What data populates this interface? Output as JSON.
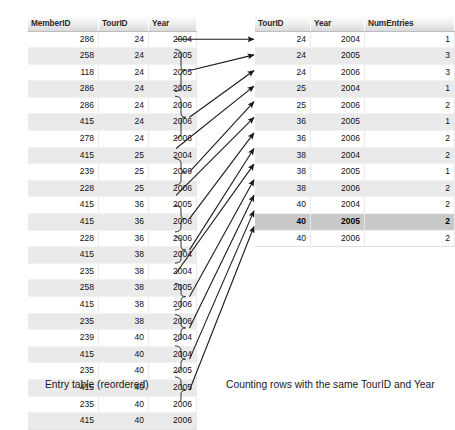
{
  "left_table": {
    "name": "entry-table",
    "headers": [
      "MemberID",
      "TourID",
      "Year"
    ],
    "rows": [
      {
        "member": "286",
        "tour": "24",
        "year": "2004",
        "alt": false
      },
      {
        "member": "258",
        "tour": "24",
        "year": "2005",
        "alt": true
      },
      {
        "member": "118",
        "tour": "24",
        "year": "2005",
        "alt": false
      },
      {
        "member": "286",
        "tour": "24",
        "year": "2005",
        "alt": true
      },
      {
        "member": "286",
        "tour": "24",
        "year": "2006",
        "alt": false
      },
      {
        "member": "415",
        "tour": "24",
        "year": "2006",
        "alt": true
      },
      {
        "member": "278",
        "tour": "24",
        "year": "2006",
        "alt": false
      },
      {
        "member": "415",
        "tour": "25",
        "year": "2004",
        "alt": true
      },
      {
        "member": "239",
        "tour": "25",
        "year": "2006",
        "alt": false
      },
      {
        "member": "228",
        "tour": "25",
        "year": "2006",
        "alt": true
      },
      {
        "member": "415",
        "tour": "36",
        "year": "2005",
        "alt": false
      },
      {
        "member": "415",
        "tour": "36",
        "year": "2006",
        "alt": true
      },
      {
        "member": "228",
        "tour": "36",
        "year": "2006",
        "alt": false
      },
      {
        "member": "415",
        "tour": "38",
        "year": "2004",
        "alt": true
      },
      {
        "member": "235",
        "tour": "38",
        "year": "2004",
        "alt": false
      },
      {
        "member": "258",
        "tour": "38",
        "year": "2005",
        "alt": true
      },
      {
        "member": "415",
        "tour": "38",
        "year": "2006",
        "alt": false
      },
      {
        "member": "235",
        "tour": "38",
        "year": "2006",
        "alt": true
      },
      {
        "member": "239",
        "tour": "40",
        "year": "2004",
        "alt": false
      },
      {
        "member": "415",
        "tour": "40",
        "year": "2004",
        "alt": true
      },
      {
        "member": "235",
        "tour": "40",
        "year": "2005",
        "alt": false
      },
      {
        "member": "415",
        "tour": "40",
        "year": "2005",
        "alt": true
      },
      {
        "member": "235",
        "tour": "40",
        "year": "2006",
        "alt": false
      },
      {
        "member": "415",
        "tour": "40",
        "year": "2006",
        "alt": true
      }
    ]
  },
  "right_table": {
    "name": "aggregate-table",
    "headers": [
      "TourID",
      "Year",
      "NumEntries"
    ],
    "rows": [
      {
        "tour": "24",
        "year": "2004",
        "num": "1",
        "alt": false,
        "selected": false
      },
      {
        "tour": "24",
        "year": "2005",
        "num": "3",
        "alt": true,
        "selected": false
      },
      {
        "tour": "24",
        "year": "2006",
        "num": "3",
        "alt": false,
        "selected": false
      },
      {
        "tour": "25",
        "year": "2004",
        "num": "1",
        "alt": true,
        "selected": false
      },
      {
        "tour": "25",
        "year": "2006",
        "num": "2",
        "alt": false,
        "selected": false
      },
      {
        "tour": "36",
        "year": "2005",
        "num": "1",
        "alt": true,
        "selected": false
      },
      {
        "tour": "36",
        "year": "2006",
        "num": "2",
        "alt": false,
        "selected": false
      },
      {
        "tour": "38",
        "year": "2004",
        "num": "2",
        "alt": true,
        "selected": false
      },
      {
        "tour": "38",
        "year": "2005",
        "num": "1",
        "alt": false,
        "selected": false
      },
      {
        "tour": "38",
        "year": "2006",
        "num": "2",
        "alt": true,
        "selected": false
      },
      {
        "tour": "40",
        "year": "2004",
        "num": "2",
        "alt": false,
        "selected": false
      },
      {
        "tour": "40",
        "year": "2005",
        "num": "2",
        "alt": true,
        "selected": true
      },
      {
        "tour": "40",
        "year": "2006",
        "num": "2",
        "alt": false,
        "selected": false
      }
    ]
  },
  "captions": {
    "left": "Entry table (reordered)",
    "right": "Counting rows with the same TourID and Year"
  },
  "connectors": {
    "description": "Braces group consecutive source rows sharing TourID and Year; an arrow points from each group to its aggregated row.",
    "groups": [
      {
        "source_rows": [
          0
        ],
        "target_row": 0,
        "count": 1
      },
      {
        "source_rows": [
          1,
          2,
          3
        ],
        "target_row": 1,
        "count": 3
      },
      {
        "source_rows": [
          4,
          5,
          6
        ],
        "target_row": 2,
        "count": 3
      },
      {
        "source_rows": [
          7
        ],
        "target_row": 3,
        "count": 1
      },
      {
        "source_rows": [
          8,
          9
        ],
        "target_row": 4,
        "count": 2
      },
      {
        "source_rows": [
          10
        ],
        "target_row": 5,
        "count": 1
      },
      {
        "source_rows": [
          11,
          12
        ],
        "target_row": 6,
        "count": 2
      },
      {
        "source_rows": [
          13,
          14
        ],
        "target_row": 7,
        "count": 2
      },
      {
        "source_rows": [
          15
        ],
        "target_row": 8,
        "count": 1
      },
      {
        "source_rows": [
          16,
          17
        ],
        "target_row": 9,
        "count": 2
      },
      {
        "source_rows": [
          18,
          19
        ],
        "target_row": 10,
        "count": 2
      },
      {
        "source_rows": [
          20,
          21
        ],
        "target_row": 11,
        "count": 2
      },
      {
        "source_rows": [
          22,
          23
        ],
        "target_row": 12,
        "count": 2
      }
    ]
  },
  "colors": {
    "stripe": "#eaeaea",
    "selected_row": "#c9c9c9",
    "header_start": "#fbfbfb",
    "header_end": "#d9d9d9",
    "connector": "#1a1a1a",
    "text": "#111111"
  }
}
